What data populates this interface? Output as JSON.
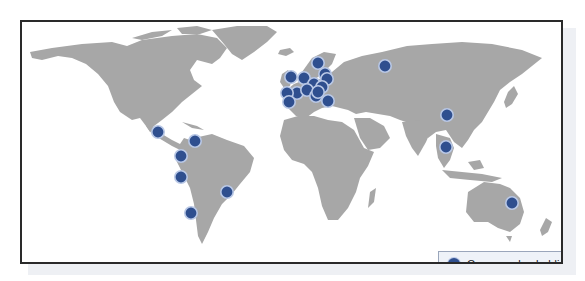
{
  "legend": {
    "label": "Car care plan holdings",
    "marker_color": "#2f4f8f"
  },
  "colors": {
    "land": "#a7a7a7",
    "marker": "#2f4f8f",
    "marker_halo": "#b9c8e6",
    "frame": "#2a2a2a"
  },
  "markers": [
    {
      "region": "Central America"
    },
    {
      "region": "Northern South America"
    },
    {
      "region": "Ecuador/Colombia"
    },
    {
      "region": "Peru"
    },
    {
      "region": "Southern Brazil"
    },
    {
      "region": "Chile/Argentina"
    },
    {
      "region": "Scandinavia"
    },
    {
      "region": "Baltics"
    },
    {
      "region": "Eastern Europe"
    },
    {
      "region": "United Kingdom"
    },
    {
      "region": "Central Europe"
    },
    {
      "region": "Central Europe"
    },
    {
      "region": "Eastern Europe"
    },
    {
      "region": "France"
    },
    {
      "region": "Alps"
    },
    {
      "region": "Iberia"
    },
    {
      "region": "Iberia"
    },
    {
      "region": "Balkans"
    },
    {
      "region": "Turkey"
    },
    {
      "region": "Eastern Europe"
    },
    {
      "region": "Russia"
    },
    {
      "region": "China"
    },
    {
      "region": "Southeast Asia"
    },
    {
      "region": "Australia"
    }
  ]
}
